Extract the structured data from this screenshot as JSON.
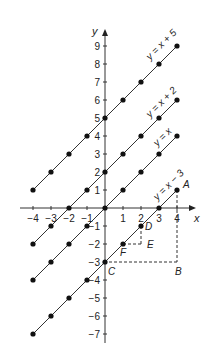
{
  "figure": {
    "axes": {
      "x_label": "x",
      "y_label": "y",
      "x_ticks": [
        -4,
        -3,
        -2,
        -1,
        1,
        2,
        3,
        4
      ],
      "x_tick_labels": [
        "−4",
        "−3",
        "−2",
        "−1",
        "1",
        "2",
        "3",
        "4"
      ],
      "y_ticks": [
        9,
        8,
        7,
        6,
        5,
        4,
        3,
        2,
        1,
        -1,
        -2,
        -3,
        -4,
        -5,
        -6,
        -7
      ],
      "y_tick_labels": [
        "9",
        "8",
        "7",
        "6",
        "5",
        "4",
        "3",
        "2",
        "1",
        "−1",
        "−2",
        "−3",
        "−4",
        "−5",
        "−6",
        "−7"
      ],
      "x_range": [
        -4.5,
        4.5
      ],
      "y_range": [
        -7.5,
        9.5
      ]
    },
    "lines": [
      {
        "label": "y = x + 5",
        "intercept": 5,
        "x_points": [
          -4,
          -3,
          -2,
          -1,
          0,
          1,
          2,
          3,
          4
        ]
      },
      {
        "label": "y = x + 2",
        "intercept": 2,
        "x_points": [
          -4,
          -3,
          -2,
          -1,
          0,
          1,
          2,
          3,
          4
        ]
      },
      {
        "label": "y = x",
        "intercept": 0,
        "x_points": [
          -4,
          -3,
          -2,
          -1,
          0,
          1,
          2,
          3,
          4
        ]
      },
      {
        "label": "y = x − 3",
        "intercept": -3,
        "x_points": [
          -4,
          -3,
          -2,
          -1,
          0,
          1,
          2,
          3,
          4
        ]
      }
    ],
    "points": [
      {
        "name": "A",
        "x": 4,
        "y": 1
      },
      {
        "name": "B",
        "x": 4,
        "y": -3
      },
      {
        "name": "C",
        "x": 0,
        "y": -3
      },
      {
        "name": "D",
        "x": 2,
        "y": -1
      },
      {
        "name": "E",
        "x": 2,
        "y": -2
      },
      {
        "name": "F",
        "x": 1,
        "y": -2
      }
    ],
    "dashed_segments": [
      {
        "from": "A",
        "to": "B"
      },
      {
        "from": "B",
        "to": "C"
      },
      {
        "from": "D",
        "to": "E"
      },
      {
        "from": "E",
        "to": "F"
      }
    ]
  }
}
